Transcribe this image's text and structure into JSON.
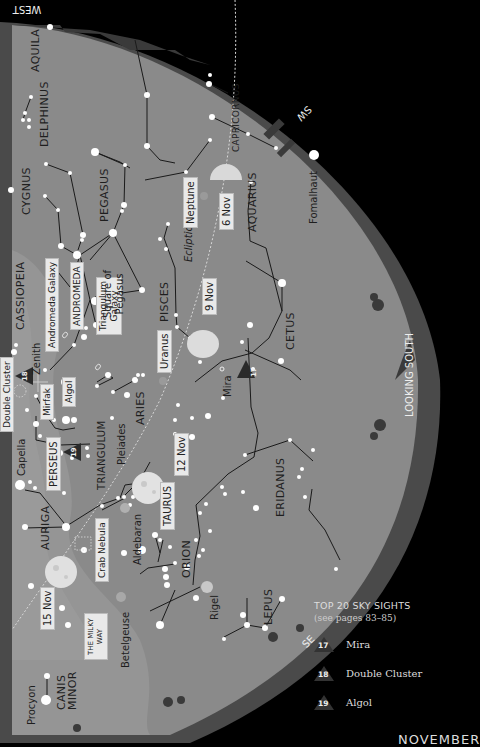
{
  "header": {
    "direction_top": "WEST"
  },
  "directions": {
    "southwest": "SW",
    "south": "LOOKING SOUTH",
    "southeast": "SE"
  },
  "constellations": [
    {
      "name": "AQUILA"
    },
    {
      "name": "DELPHINUS"
    },
    {
      "name": "CAPRICORNUS"
    },
    {
      "name": "CYGNUS"
    },
    {
      "name": "PEGASUS"
    },
    {
      "name": "AQUARIUS"
    },
    {
      "name": "CASSIOPEIA"
    },
    {
      "name": "ANDROMEDA"
    },
    {
      "name": "PISCES"
    },
    {
      "name": "CETUS"
    },
    {
      "name": "TRIANGULUM"
    },
    {
      "name": "ARIES"
    },
    {
      "name": "PERSEUS"
    },
    {
      "name": "AURIGA"
    },
    {
      "name": "TAURUS"
    },
    {
      "name": "ERIDANUS"
    },
    {
      "name": "ORION"
    },
    {
      "name": "LEPUS"
    },
    {
      "name": "CANIS MINOR"
    }
  ],
  "stars": {
    "fomalhaut": "Fomalhaut",
    "capella": "Capella",
    "mirfak": "Mirfak",
    "algol": "Algol",
    "mira": "Mira",
    "aldebaran": "Aldebaran",
    "betelgeuse": "Betelgeuse",
    "rigel": "Rigel",
    "procyon": "Procyon"
  },
  "objects": {
    "andromeda_galaxy": "Andromeda Galaxy",
    "triangulum_galaxy_1": "Triangulum",
    "triangulum_galaxy_2": "Galaxy",
    "square_of_pegasus_1": "Square of",
    "square_of_pegasus_2": "Pegasus",
    "double_cluster": "Double Cluster",
    "pleiades": "Pleiades",
    "crab_nebula": "Crab Nebula",
    "milky_way_1": "THE MILKY",
    "milky_way_2": "WAY",
    "zenith": "Zenith",
    "ecliptic": "Ecliptic"
  },
  "planets": {
    "neptune": "Neptune",
    "uranus": "Uranus"
  },
  "moon_phases": [
    {
      "date": "6 Nov",
      "phase": "half"
    },
    {
      "date": "9 Nov",
      "phase": "gibbous"
    },
    {
      "date": "12 Nov",
      "phase": "full"
    },
    {
      "date": "15 Nov",
      "phase": "full"
    }
  ],
  "markers": [
    {
      "number": "17",
      "label": "Mira"
    },
    {
      "number": "18",
      "label": "Double Cluster"
    },
    {
      "number": "19",
      "label": "Algol"
    }
  ],
  "legend": {
    "title": "TOP 20 SKY SIGHTS",
    "subtitle": "(see pages 83–85)",
    "items": [
      {
        "number": "17",
        "label": "Mira"
      },
      {
        "number": "18",
        "label": "Double Cluster"
      },
      {
        "number": "19",
        "label": "Algol"
      }
    ]
  },
  "footer": {
    "month": "NOVEMBER"
  },
  "colors": {
    "background": "#000000",
    "sky": "#8a8a8a",
    "milky_way": "#9c9c9c",
    "horizon": "#4a4a4a",
    "star": "#ffffff",
    "line": "#1a1a1a"
  }
}
